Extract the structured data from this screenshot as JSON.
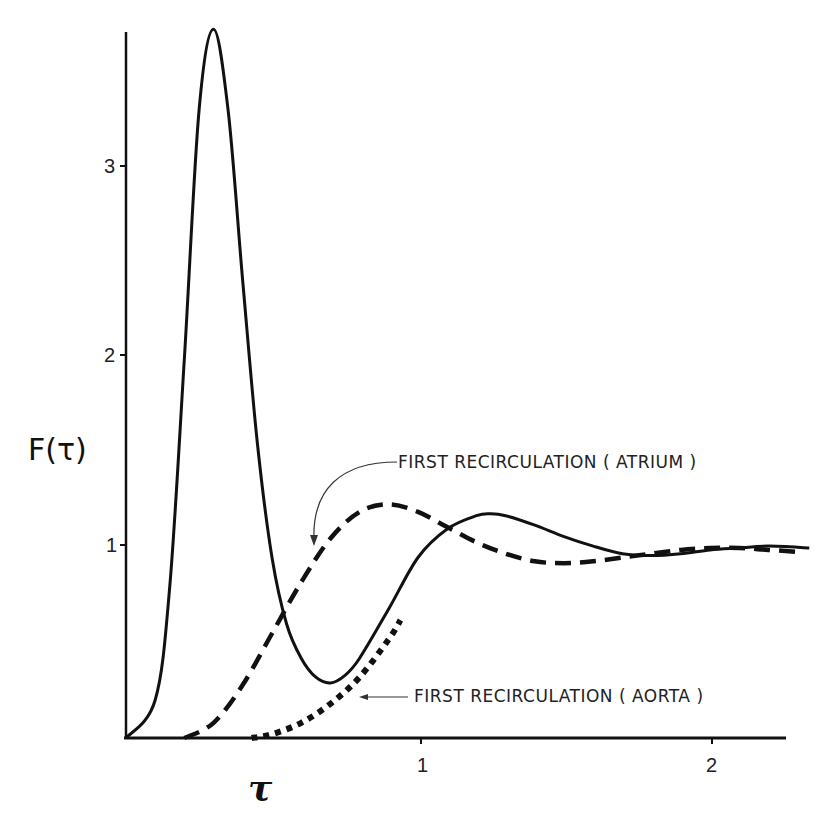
{
  "chart_data": {
    "type": "line",
    "title": "",
    "xlabel": "τ",
    "ylabel": "F(τ)",
    "xlim": [
      0,
      2.35
    ],
    "ylim": [
      0,
      3.8
    ],
    "x_ticks": [
      1,
      2
    ],
    "x_tick_labels": [
      "1",
      "2"
    ],
    "y_ticks": [
      1,
      2,
      3
    ],
    "y_tick_labels": [
      "1",
      "2",
      "3"
    ],
    "grid": false,
    "legend": null,
    "series": [
      {
        "name": "F(τ) total",
        "style": "solid",
        "x": [
          0.0,
          0.1,
          0.15,
          0.2,
          0.25,
          0.3,
          0.35,
          0.4,
          0.45,
          0.5,
          0.55,
          0.6,
          0.65,
          0.7,
          0.75,
          0.8,
          0.9,
          1.0,
          1.1,
          1.2,
          1.25,
          1.3,
          1.4,
          1.5,
          1.6,
          1.7,
          1.8,
          1.9,
          2.0,
          2.1,
          2.2,
          2.34
        ],
        "values": [
          0.0,
          0.2,
          0.8,
          2.0,
          3.3,
          3.73,
          3.3,
          2.4,
          1.55,
          0.95,
          0.6,
          0.42,
          0.32,
          0.29,
          0.33,
          0.42,
          0.68,
          0.95,
          1.1,
          1.17,
          1.18,
          1.17,
          1.12,
          1.06,
          1.01,
          0.97,
          0.96,
          0.97,
          0.99,
          1.0,
          1.01,
          1.0
        ]
      },
      {
        "name": "First recirculation (atrium)",
        "style": "dashed",
        "x": [
          0.2,
          0.3,
          0.4,
          0.5,
          0.6,
          0.7,
          0.8,
          0.9,
          1.0,
          1.1,
          1.2,
          1.3,
          1.4,
          1.5,
          1.6,
          1.7,
          1.8,
          1.9,
          2.0,
          2.1,
          2.2,
          2.3
        ],
        "values": [
          0.0,
          0.08,
          0.28,
          0.55,
          0.82,
          1.05,
          1.19,
          1.23,
          1.19,
          1.11,
          1.03,
          0.97,
          0.93,
          0.92,
          0.93,
          0.95,
          0.97,
          0.99,
          1.0,
          1.0,
          0.99,
          0.98
        ]
      },
      {
        "name": "First recirculation (aorta)",
        "style": "dotted",
        "x": [
          0.43,
          0.5,
          0.6,
          0.7,
          0.8,
          0.9,
          0.94
        ],
        "values": [
          0.0,
          0.02,
          0.08,
          0.18,
          0.32,
          0.52,
          0.62
        ]
      }
    ],
    "annotations": [
      {
        "text": "FIRST  RECIRCULATION ( ATRIUM )",
        "points_to": "dashed curve near τ≈0.65, F≈0.98"
      },
      {
        "text": "FIRST  RECIRCULATION ( AORTA )",
        "points_to": "dotted curve near τ≈0.8, F≈0.3"
      }
    ]
  },
  "axes": {
    "ylabel": "F(τ)",
    "xlabel": "τ",
    "y_tick_1": "1",
    "y_tick_2": "2",
    "y_tick_3": "3",
    "x_tick_1": "1",
    "x_tick_2": "2"
  },
  "annotations": {
    "atrium": "FIRST  RECIRCULATION ( ATRIUM )",
    "aorta": "FIRST  RECIRCULATION ( AORTA )"
  },
  "colors": {
    "ink": "#111111",
    "background": "#ffffff"
  }
}
